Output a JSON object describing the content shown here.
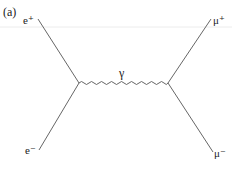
{
  "diagram": {
    "panel_label": "(a)",
    "type": "feynman",
    "process": "e+ e- -> gamma -> mu+ mu-",
    "particles": {
      "top_left": "e⁺",
      "bottom_left": "e⁻",
      "top_right": "μ⁺",
      "bottom_right": "μ⁻",
      "propagator": "γ"
    },
    "colors": {
      "line": "#555555",
      "text": "#222222",
      "guide": "#e6e6e6"
    }
  }
}
